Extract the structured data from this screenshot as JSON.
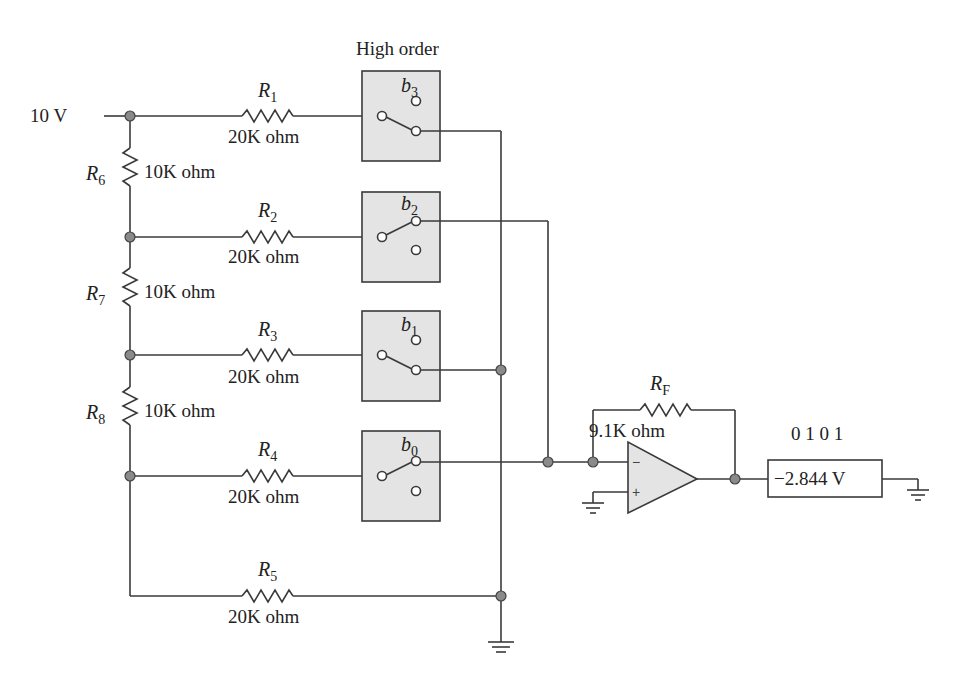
{
  "source": {
    "label": "10 V"
  },
  "switch_group_label": "High order",
  "ladder_resistors": [
    {
      "name": "R",
      "sub": "6",
      "value": "10K ohm"
    },
    {
      "name": "R",
      "sub": "7",
      "value": "10K ohm"
    },
    {
      "name": "R",
      "sub": "8",
      "value": "10K ohm"
    }
  ],
  "branch_resistors": [
    {
      "name": "R",
      "sub": "1",
      "value": "20K ohm"
    },
    {
      "name": "R",
      "sub": "2",
      "value": "20K ohm"
    },
    {
      "name": "R",
      "sub": "3",
      "value": "20K ohm"
    },
    {
      "name": "R",
      "sub": "4",
      "value": "20K ohm"
    },
    {
      "name": "R",
      "sub": "5",
      "value": "20K ohm"
    }
  ],
  "switches": [
    {
      "name": "b",
      "sub": "3",
      "state": "ground"
    },
    {
      "name": "b",
      "sub": "2",
      "state": "summing"
    },
    {
      "name": "b",
      "sub": "1",
      "state": "ground"
    },
    {
      "name": "b",
      "sub": "0",
      "state": "summing"
    }
  ],
  "feedback_resistor": {
    "name": "R",
    "sub": "F",
    "value": "9.1K ohm"
  },
  "opamp": {
    "minus": "−",
    "plus": "+"
  },
  "output": {
    "code": "0 1 0 1",
    "reading": "−2.844 V"
  }
}
